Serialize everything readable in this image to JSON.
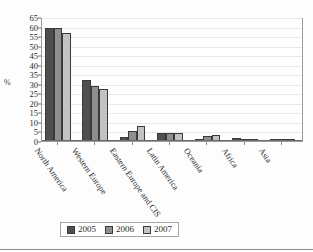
{
  "chart_data": {
    "type": "bar",
    "title": "",
    "xlabel": "",
    "ylabel": "%",
    "ylim": [
      0,
      65
    ],
    "yticks": [
      0,
      5,
      10,
      15,
      20,
      25,
      30,
      35,
      40,
      45,
      50,
      55,
      60,
      65
    ],
    "grid": true,
    "legend_position": "bottom",
    "categories": [
      "North America",
      "Western Europe",
      "Eastern Europe and CIS",
      "Latin America",
      "Oceania",
      "Africa",
      "Asia"
    ],
    "series": [
      {
        "name": "2005",
        "color": "#4f4f4f",
        "values": [
          59,
          32,
          2,
          4,
          1,
          1.5,
          0.4
        ]
      },
      {
        "name": "2006",
        "color": "#8e8e8e",
        "values": [
          59,
          29,
          5,
          4,
          2.5,
          1,
          0.5
        ]
      },
      {
        "name": "2007",
        "color": "#c2c2c2",
        "values": [
          56.5,
          27.5,
          8,
          4,
          3,
          0.8,
          0.5
        ]
      }
    ]
  },
  "legend": {
    "items": [
      {
        "label": "2005",
        "color": "#4f4f4f"
      },
      {
        "label": "2006",
        "color": "#8e8e8e"
      },
      {
        "label": "2007",
        "color": "#c2c2c2"
      }
    ]
  },
  "axis": {
    "y_title": "%"
  }
}
